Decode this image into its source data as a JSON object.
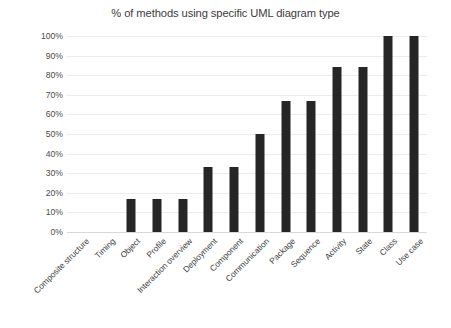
{
  "chart_data": {
    "type": "bar",
    "title": "% of methods using specific UML diagram type",
    "xlabel": "",
    "ylabel": "",
    "ylim": [
      0,
      100
    ],
    "yticks": [
      "0%",
      "10%",
      "20%",
      "30%",
      "40%",
      "50%",
      "60%",
      "70%",
      "80%",
      "90%",
      "100%"
    ],
    "ytick_values": [
      0,
      10,
      20,
      30,
      40,
      50,
      60,
      70,
      80,
      90,
      100
    ],
    "grid": true,
    "legend": "none",
    "bar_color": "#262626",
    "gridline_color": "#ececec",
    "background_color": "#ffffff",
    "categories": [
      "Composite structure",
      "Timing",
      "Object",
      "Profile",
      "Interaction overview",
      "Deployment",
      "Component",
      "Communication",
      "Package",
      "Sequence",
      "Activity",
      "State",
      "Class",
      "Use case"
    ],
    "values": [
      0,
      0,
      17,
      17,
      17,
      33,
      33,
      50,
      67,
      67,
      84,
      84,
      100,
      100
    ],
    "series": [
      {
        "name": "% of methods",
        "values": [
          0,
          0,
          17,
          17,
          17,
          33,
          33,
          50,
          67,
          67,
          84,
          84,
          100,
          100
        ]
      }
    ]
  }
}
